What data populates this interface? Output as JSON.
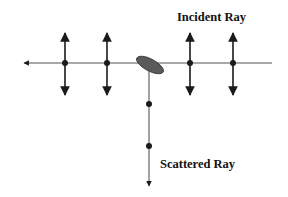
{
  "diagram": {
    "labels": {
      "incident": "Incident Ray",
      "scattered": "Scattered Ray"
    },
    "colors": {
      "line": "#555555",
      "arrow": "#1a1a1a",
      "scatterer": "#5a5a5a",
      "background": "#ffffff"
    },
    "incident_ray": {
      "y": 63,
      "x_start": 272,
      "x_end": 22,
      "direction": "left",
      "polarization_arrow_x": [
        65,
        107,
        190,
        233
      ]
    },
    "scatterer": {
      "shape": "ellipse",
      "cx": 150,
      "cy": 65,
      "rx": 15,
      "ry": 6,
      "rotation": 28
    },
    "scattered_ray": {
      "x": 149,
      "y_start": 68,
      "y_end": 187,
      "direction": "down",
      "dot_y": [
        104,
        146
      ]
    }
  }
}
